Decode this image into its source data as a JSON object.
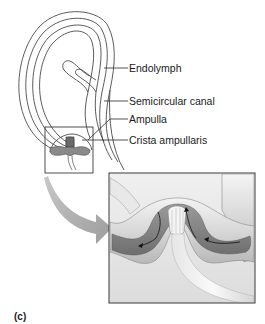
{
  "figure": {
    "panel_letter": "(c)",
    "labels": [
      {
        "id": "endolymph",
        "text": "Endolymph"
      },
      {
        "id": "semicircular-canal",
        "text": "Semicircular canal"
      },
      {
        "id": "ampulla",
        "text": "Ampulla"
      },
      {
        "id": "crista-ampullaris",
        "text": "Crista ampullaris"
      }
    ],
    "colors": {
      "outline": "#4a4a4a",
      "crista_gray": "#8a8a8a",
      "inset_bg": "#e4e4e4",
      "arrow_gray": "#a8a8a8",
      "text": "#1a1a1a"
    }
  }
}
